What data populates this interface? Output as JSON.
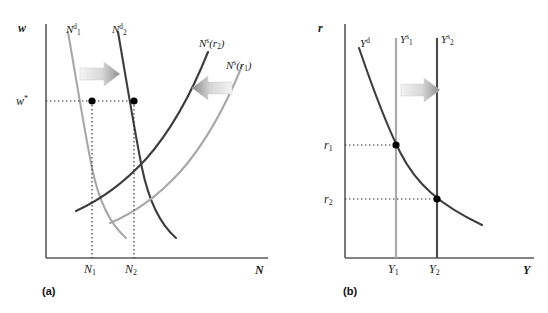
{
  "figure": {
    "type": "economics-diagram",
    "colors": {
      "dark_curve": "#3d3d3d",
      "light_curve": "#a8a8a8",
      "axis": "#5a5a5a",
      "dotted": "#333333",
      "point": "#000000",
      "arrow_light": "#efefef",
      "arrow_dark": "#9e9e9e"
    },
    "panels": [
      {
        "id": "a",
        "caption": "(a)",
        "y_axis_label": "w",
        "x_axis_label": "N",
        "value_ticks": [
          {
            "name": "w-star-tick",
            "label": "w*",
            "axis": "y"
          },
          {
            "name": "n1-tick",
            "label": "N",
            "sub": "1",
            "axis": "x"
          },
          {
            "name": "n2-tick",
            "label": "N",
            "sub": "2",
            "axis": "x"
          }
        ],
        "curves": [
          {
            "name": "labour-demand-1",
            "label": "N",
            "sup": "d",
            "sub": "1",
            "tone": "light"
          },
          {
            "name": "labour-demand-2",
            "label": "N",
            "sup": "d",
            "sub": "2",
            "tone": "dark"
          },
          {
            "name": "labour-supply-r2",
            "label": "N",
            "sup": "s",
            "paren": "(r",
            "parensub": "2",
            "parenclose": ")",
            "tone": "dark"
          },
          {
            "name": "labour-supply-r1",
            "label": "N",
            "sup": "s",
            "paren": "(r",
            "parensub": "1",
            "parenclose": ")",
            "tone": "light"
          }
        ],
        "arrows": [
          {
            "name": "demand-shift-arrow",
            "direction": "right"
          },
          {
            "name": "supply-shift-arrow",
            "direction": "left"
          }
        ],
        "equilibria": [
          {
            "name": "equilibrium-point-1",
            "x_label": "N1",
            "y_label": "w*"
          },
          {
            "name": "equilibrium-point-2",
            "x_label": "N2",
            "y_label": "w*"
          }
        ]
      },
      {
        "id": "b",
        "caption": "(b)",
        "y_axis_label": "r",
        "x_axis_label": "Y",
        "value_ticks": [
          {
            "name": "r1-tick",
            "label": "r",
            "sub": "1",
            "axis": "y"
          },
          {
            "name": "r2-tick",
            "label": "r",
            "sub": "2",
            "axis": "y"
          },
          {
            "name": "y1-tick",
            "label": "Y",
            "sub": "1",
            "axis": "x"
          },
          {
            "name": "y2-tick",
            "label": "Y",
            "sub": "2",
            "axis": "x"
          }
        ],
        "curves": [
          {
            "name": "output-demand",
            "label": "Y",
            "sup": "d",
            "tone": "dark"
          },
          {
            "name": "output-supply-1",
            "label": "Y",
            "sup": "s",
            "sub": "1",
            "tone": "light"
          },
          {
            "name": "output-supply-2",
            "label": "Y",
            "sup": "s",
            "sub": "2",
            "tone": "dark"
          }
        ],
        "arrows": [
          {
            "name": "output-shift-arrow",
            "direction": "right"
          }
        ],
        "equilibria": [
          {
            "name": "equilibrium-point-1",
            "x_label": "Y1",
            "y_label": "r1"
          },
          {
            "name": "equilibrium-point-2",
            "x_label": "Y2",
            "y_label": "r2"
          }
        ]
      }
    ]
  },
  "labels": {
    "panel_a": {
      "w_axis": "w",
      "n_axis": "N",
      "w_star": "w",
      "w_star_sup": "*",
      "n1": "N",
      "n1_sub": "1",
      "n2": "N",
      "n2_sub": "2",
      "nd1": "N",
      "nd1_sup": "d",
      "nd1_sub": "1",
      "nd2": "N",
      "nd2_sup": "d",
      "nd2_sub": "2",
      "ns_r2": "N",
      "ns_r2_sup": "s",
      "ns_r2_arg": "(r",
      "ns_r2_argsub": "2",
      "ns_r2_argclose": ")",
      "ns_r1": "N",
      "ns_r1_sup": "s",
      "ns_r1_arg": "(r",
      "ns_r1_argsub": "1",
      "ns_r1_argclose": ")",
      "caption": "(a)"
    },
    "panel_b": {
      "r_axis": "r",
      "y_axis": "Y",
      "r1": "r",
      "r1_sub": "1",
      "r2": "r",
      "r2_sub": "2",
      "y1": "Y",
      "y1_sub": "1",
      "y2": "Y",
      "y2_sub": "2",
      "yd": "Y",
      "yd_sup": "d",
      "ys1": "Y",
      "ys1_sup": "s",
      "ys1_sub": "1",
      "ys2": "Y",
      "ys2_sup": "s",
      "ys2_sub": "2",
      "caption": "(b)"
    }
  }
}
